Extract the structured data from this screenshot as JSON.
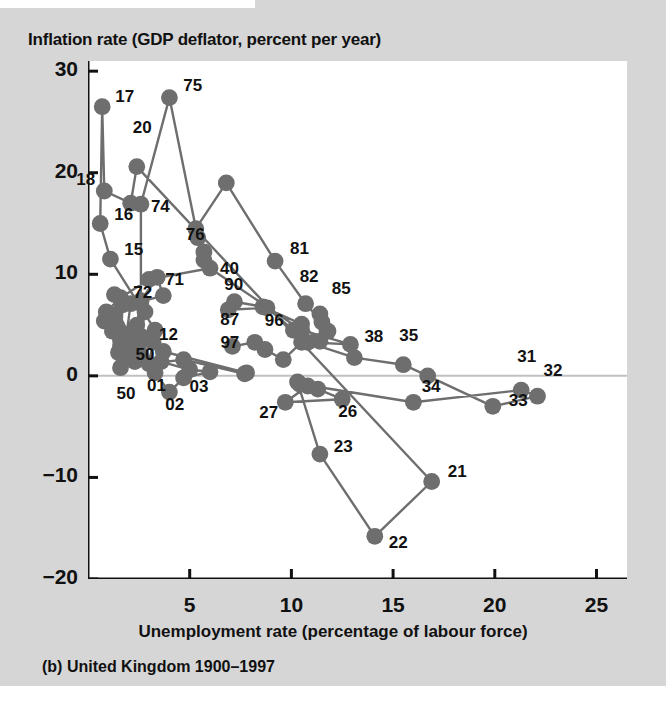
{
  "figure": {
    "caption": "(b) United Kingdom 1900–1997",
    "axis_title_y": "Inflation rate (GDP deflator, percent per year)",
    "axis_title_x": "Unemployment rate (percentage of labour force)"
  },
  "colors": {
    "page_background": "#d6d6d6",
    "plot_background": "#ffffff",
    "marker": "#6e6e6e",
    "line": "#6e6e6e",
    "axis": "#111111",
    "zero_line": "#c0c0c0",
    "text": "#111111"
  },
  "chart_data": {
    "type": "scatter",
    "title": "",
    "subtitle": "(b) United Kingdom 1900–1997",
    "xlabel": "Unemployment rate (percentage of labour force)",
    "ylabel": "Inflation rate (GDP deflator, percent per year)",
    "xlim": [
      0,
      26.5
    ],
    "ylim": [
      -20,
      31
    ],
    "xticks": [
      5,
      10,
      15,
      20,
      25
    ],
    "yticks": [
      30,
      20,
      10,
      0,
      -10,
      -20
    ],
    "xtick_labels": [
      "5",
      "10",
      "15",
      "20",
      "25"
    ],
    "ytick_labels": [
      "30",
      "20",
      "10",
      "0",
      "−10",
      "−20"
    ],
    "grid": false,
    "legend": null,
    "zero_line": 0,
    "connected": true,
    "series": [
      {
        "name": "United Kingdom 1900–1997",
        "points": [
          {
            "year": "00",
            "x": 2.5,
            "y": 4.0,
            "label": null
          },
          {
            "year": "01",
            "x": 3.3,
            "y": 0.3,
            "label": "01"
          },
          {
            "year": "02",
            "x": 4.0,
            "y": -1.6,
            "label": "02"
          },
          {
            "year": "03",
            "x": 4.7,
            "y": -0.2,
            "label": "03"
          },
          {
            "year": "04",
            "x": 6.0,
            "y": 0.4,
            "label": null
          },
          {
            "year": "05",
            "x": 5.0,
            "y": 0.6,
            "label": null
          },
          {
            "year": "06",
            "x": 3.6,
            "y": 1.4,
            "label": null
          },
          {
            "year": "07",
            "x": 3.7,
            "y": 2.4,
            "label": null
          },
          {
            "year": "08",
            "x": 7.8,
            "y": 0.3,
            "label": null
          },
          {
            "year": "09",
            "x": 7.7,
            "y": 0.2,
            "label": null
          },
          {
            "year": "10",
            "x": 4.7,
            "y": 1.6,
            "label": null
          },
          {
            "year": "11",
            "x": 3.0,
            "y": 1.2,
            "label": null
          },
          {
            "year": "12",
            "x": 3.2,
            "y": 3.3,
            "label": "12"
          },
          {
            "year": "13",
            "x": 2.1,
            "y": 2.3,
            "label": null
          },
          {
            "year": "14",
            "x": 3.3,
            "y": 4.5,
            "label": null
          },
          {
            "year": "15",
            "x": 1.1,
            "y": 11.5,
            "label": "15"
          },
          {
            "year": "16",
            "x": 0.6,
            "y": 15.0,
            "label": "16"
          },
          {
            "year": "17",
            "x": 0.7,
            "y": 26.5,
            "label": "17"
          },
          {
            "year": "18",
            "x": 0.8,
            "y": 18.2,
            "label": "18"
          },
          {
            "year": "19",
            "x": 2.1,
            "y": 17.0,
            "label": null
          },
          {
            "year": "20",
            "x": 2.4,
            "y": 20.6,
            "label": "20"
          },
          {
            "year": "21",
            "x": 16.9,
            "y": -10.4,
            "label": "21"
          },
          {
            "year": "22",
            "x": 14.1,
            "y": -15.8,
            "label": "22"
          },
          {
            "year": "23",
            "x": 11.4,
            "y": -7.7,
            "label": "23"
          },
          {
            "year": "24",
            "x": 10.3,
            "y": -0.6,
            "label": null
          },
          {
            "year": "25",
            "x": 11.3,
            "y": -1.3,
            "label": null
          },
          {
            "year": "26",
            "x": 12.5,
            "y": -2.3,
            "label": "26"
          },
          {
            "year": "27",
            "x": 9.7,
            "y": -2.6,
            "label": "27"
          },
          {
            "year": "28",
            "x": 10.8,
            "y": -1.0,
            "label": null
          },
          {
            "year": "29",
            "x": 10.4,
            "y": -0.8,
            "label": null
          },
          {
            "year": "30",
            "x": 16.0,
            "y": -2.6,
            "label": null
          },
          {
            "year": "31",
            "x": 21.3,
            "y": -1.4,
            "label": "31"
          },
          {
            "year": "32",
            "x": 22.1,
            "y": -2.0,
            "label": "32"
          },
          {
            "year": "33",
            "x": 19.9,
            "y": -3.0,
            "label": "33"
          },
          {
            "year": "34",
            "x": 16.7,
            "y": 0.0,
            "label": "34"
          },
          {
            "year": "35",
            "x": 15.5,
            "y": 1.1,
            "label": "35"
          },
          {
            "year": "36",
            "x": 13.1,
            "y": 1.8,
            "label": null
          },
          {
            "year": "37",
            "x": 10.8,
            "y": 3.3,
            "label": null
          },
          {
            "year": "38",
            "x": 12.9,
            "y": 3.1,
            "label": "38"
          },
          {
            "year": "39",
            "x": 10.5,
            "y": 4.5,
            "label": null
          },
          {
            "year": "40",
            "x": 6.0,
            "y": 10.6,
            "label": "40"
          },
          {
            "year": "41",
            "x": 3.0,
            "y": 9.5,
            "label": null
          },
          {
            "year": "42",
            "x": 1.6,
            "y": 7.7,
            "label": null
          },
          {
            "year": "43",
            "x": 0.9,
            "y": 6.3,
            "label": null
          },
          {
            "year": "44",
            "x": 0.8,
            "y": 5.4,
            "label": null
          },
          {
            "year": "45",
            "x": 1.4,
            "y": 5.0,
            "label": null
          },
          {
            "year": "46",
            "x": 2.6,
            "y": 3.9,
            "label": null
          },
          {
            "year": "47",
            "x": 2.8,
            "y": 6.3,
            "label": null
          },
          {
            "year": "48",
            "x": 1.7,
            "y": 7.0,
            "label": null
          },
          {
            "year": "49",
            "x": 1.6,
            "y": 3.0,
            "label": null
          },
          {
            "year": "50",
            "x": 1.6,
            "y": 0.8,
            "label": "50"
          },
          {
            "year": "51",
            "x": 1.3,
            "y": 8.0,
            "label": null
          },
          {
            "year": "52",
            "x": 2.1,
            "y": 7.1,
            "label": null
          },
          {
            "year": "53",
            "x": 1.8,
            "y": 2.7,
            "label": null
          },
          {
            "year": "54",
            "x": 1.5,
            "y": 2.3,
            "label": null
          },
          {
            "year": "55",
            "x": 1.2,
            "y": 4.4,
            "label": null
          },
          {
            "year": "56",
            "x": 1.3,
            "y": 6.0,
            "label": null
          },
          {
            "year": "57",
            "x": 1.6,
            "y": 4.1,
            "label": null
          },
          {
            "year": "58",
            "x": 2.2,
            "y": 4.3,
            "label": null
          },
          {
            "year": "59",
            "x": 2.3,
            "y": 1.4,
            "label": null
          },
          {
            "year": "60",
            "x": 1.7,
            "y": 2.0,
            "label": null
          },
          {
            "year": "61",
            "x": 1.6,
            "y": 3.5,
            "label": null
          },
          {
            "year": "62",
            "x": 2.1,
            "y": 4.0,
            "label": null
          },
          {
            "year": "63",
            "x": 2.6,
            "y": 2.1,
            "label": null
          },
          {
            "year": "64",
            "x": 1.7,
            "y": 3.2,
            "label": null
          },
          {
            "year": "65",
            "x": 1.5,
            "y": 4.6,
            "label": null
          },
          {
            "year": "66",
            "x": 1.6,
            "y": 4.2,
            "label": null
          },
          {
            "year": "67",
            "x": 2.5,
            "y": 3.1,
            "label": null
          },
          {
            "year": "68",
            "x": 2.5,
            "y": 4.0,
            "label": null
          },
          {
            "year": "69",
            "x": 2.4,
            "y": 5.0,
            "label": null
          },
          {
            "year": "70",
            "x": 2.6,
            "y": 7.4,
            "label": null
          },
          {
            "year": "71",
            "x": 3.4,
            "y": 9.7,
            "label": "71"
          },
          {
            "year": "72",
            "x": 3.7,
            "y": 7.9,
            "label": "72"
          },
          {
            "year": "73",
            "x": 2.6,
            "y": 7.3,
            "label": null
          },
          {
            "year": "74",
            "x": 2.6,
            "y": 16.9,
            "label": "74"
          },
          {
            "year": "75",
            "x": 4.0,
            "y": 27.4,
            "label": "75"
          },
          {
            "year": "76",
            "x": 5.4,
            "y": 13.6,
            "label": "76"
          },
          {
            "year": "77",
            "x": 5.7,
            "y": 12.2,
            "label": null
          },
          {
            "year": "78",
            "x": 5.7,
            "y": 11.4,
            "label": null
          },
          {
            "year": "79",
            "x": 5.3,
            "y": 14.5,
            "label": null
          },
          {
            "year": "80",
            "x": 6.8,
            "y": 19.0,
            "label": null
          },
          {
            "year": "81",
            "x": 9.2,
            "y": 11.3,
            "label": "81"
          },
          {
            "year": "82",
            "x": 10.7,
            "y": 7.1,
            "label": "82"
          },
          {
            "year": "83",
            "x": 11.5,
            "y": 5.3,
            "label": null
          },
          {
            "year": "84",
            "x": 11.8,
            "y": 4.4,
            "label": null
          },
          {
            "year": "85",
            "x": 11.4,
            "y": 6.1,
            "label": "85"
          },
          {
            "year": "86",
            "x": 11.4,
            "y": 3.4,
            "label": null
          },
          {
            "year": "87",
            "x": 10.5,
            "y": 5.1,
            "label": null
          },
          {
            "year": "88",
            "x": 8.6,
            "y": 6.8,
            "label": null
          },
          {
            "year": "89",
            "x": 7.2,
            "y": 7.3,
            "label": null
          },
          {
            "year": "90",
            "x": 6.9,
            "y": 6.5,
            "label": "90"
          },
          {
            "year": "91",
            "x": 8.8,
            "y": 6.7,
            "label": null
          },
          {
            "year": "92",
            "x": 10.1,
            "y": 4.5,
            "label": null
          },
          {
            "year": "93",
            "x": 10.5,
            "y": 3.3,
            "label": null
          },
          {
            "year": "94",
            "x": 9.6,
            "y": 1.6,
            "label": null
          },
          {
            "year": "95",
            "x": 8.7,
            "y": 2.6,
            "label": null
          },
          {
            "year": "96",
            "x": 8.2,
            "y": 3.3,
            "label": "96"
          },
          {
            "year": "97",
            "x": 7.1,
            "y": 2.9,
            "label": "97"
          }
        ],
        "extra_labels": [
          {
            "text": "87",
            "x": 6.5,
            "y": 5.6
          },
          {
            "text": "50",
            "x": 1.4,
            "y": -1.7
          }
        ]
      }
    ]
  }
}
